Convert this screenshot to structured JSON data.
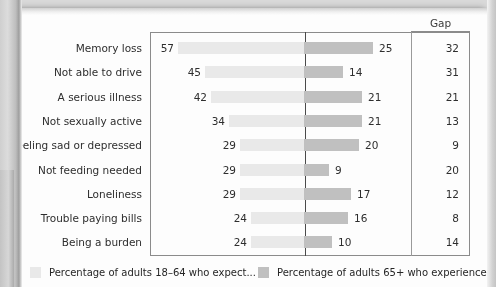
{
  "chart_data": {
    "type": "bar",
    "subtype": "tornado",
    "title": "",
    "xlabel": "",
    "ylabel": "",
    "gap_column_header": "Gap",
    "categories": [
      "Memory loss",
      "Not able to drive",
      "A serious illness",
      "Not sexually active",
      "Feeling sad or depressed",
      "Not feeding needed",
      "Loneliness",
      "Trouble paying bills",
      "Being a burden"
    ],
    "series": [
      {
        "name": "Percentage of adults 18–64 who expect...",
        "direction": "left",
        "color": "#e9e9e9",
        "values": [
          57,
          45,
          42,
          34,
          29,
          29,
          29,
          24,
          24
        ]
      },
      {
        "name": "Percentage of adults 65+ who experience...",
        "direction": "right",
        "color": "#c0c0c0",
        "values": [
          25,
          14,
          21,
          21,
          20,
          9,
          17,
          16,
          10
        ]
      }
    ],
    "gap": [
      32,
      31,
      21,
      13,
      9,
      20,
      12,
      8,
      14
    ],
    "axis_max_left": 57,
    "axis_max_right": 25,
    "grid": false,
    "legend_position": "bottom"
  },
  "legend": [
    {
      "label": "Percentage of adults 18–64 who expect...",
      "color": "#e9e9e9"
    },
    {
      "label": "Percentage of adults 65+ who experience...",
      "color": "#c0c0c0"
    }
  ]
}
